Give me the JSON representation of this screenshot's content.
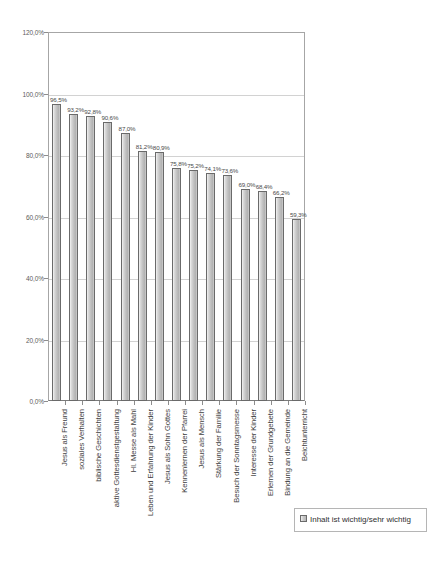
{
  "chart_data": {
    "type": "bar",
    "title": "",
    "xlabel": "",
    "ylabel": "",
    "ylim": [
      0,
      120
    ],
    "ytick_labels": [
      "120,0%",
      "100,0%",
      "80,0%",
      "60,0%",
      "40,0%",
      "20,0%",
      "0,0%"
    ],
    "ytick_values": [
      120,
      100,
      80,
      60,
      40,
      20,
      0
    ],
    "grid": true,
    "legend_position": "bottom-right",
    "legend": [
      "Inhalt ist wichtig/sehr wichtig"
    ],
    "categories": [
      "Jesus als Freund",
      "soziales Verhalten",
      "biblische Geschichten",
      "aktive Gottesdienstgestaltung",
      "Hl. Messe als Mahl",
      "Leben und Erfahrung der Kinder",
      "Jesus als Sohn Gottes",
      "Kennenlernen der Pfarrei",
      "Jesus als Mensch",
      "Stärkung der Familie",
      "Besuch der Sonntagsmesse",
      "Interesse der Kinder",
      "Erlernen der Grundgebete",
      "Bindung an die Gemeinde",
      "Beichtunterricht"
    ],
    "values": [
      96.5,
      93.2,
      92.8,
      90.6,
      87.0,
      81.2,
      80.9,
      75.8,
      75.2,
      74.1,
      73.6,
      69.0,
      68.4,
      66.2,
      59.3
    ],
    "value_labels": [
      "96,5%",
      "93,2%",
      "92,8%",
      "90,6%",
      "87,0%",
      "81,2%",
      "80,9%",
      "75,8%",
      "75,2%",
      "74,1%",
      "73,6%",
      "69,0%",
      "68,4%",
      "66,2%",
      "59,3%"
    ],
    "series": [
      {
        "name": "Inhalt ist wichtig/sehr wichtig",
        "values": [
          96.5,
          93.2,
          92.8,
          90.6,
          87.0,
          81.2,
          80.9,
          75.8,
          75.2,
          74.1,
          73.6,
          69.0,
          68.4,
          66.2,
          59.3
        ]
      }
    ],
    "colors": {
      "bar_fill": "#c0c0c0",
      "bar_border": "#6a6a6a",
      "gridline": "#d2d2d2",
      "axis": "#a6a6a6",
      "text": "#3f3f3f"
    }
  }
}
